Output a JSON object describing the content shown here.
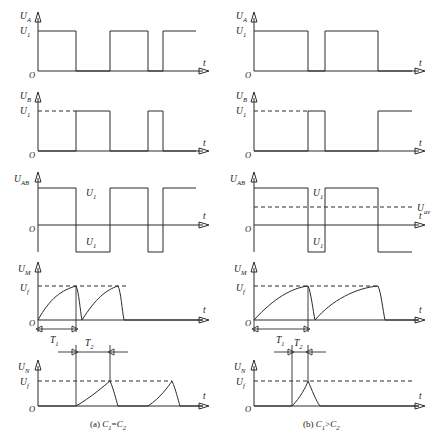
{
  "figure": {
    "background": "#ffffff",
    "ink": "#2b2b2b",
    "width": 436,
    "height": 440
  },
  "axis": {
    "origin_label": "O",
    "time_label": "t"
  },
  "columns": [
    {
      "id": "a",
      "caption_prefix": "(a)",
      "caption_expr": "C₁=C₂",
      "caption_c1": "C",
      "caption_c1_sub": "1",
      "caption_rel": "=",
      "caption_c2": "C",
      "caption_c2_sub": "2",
      "rows": [
        {
          "id": "ua",
          "signal": "U",
          "signal_sub": "A",
          "level_label": "U",
          "level_sub": "1",
          "kind": "square-unipolar",
          "dashed_ref": false,
          "duty": "50%",
          "edges_pct": [
            0,
            22,
            42,
            63,
            82,
            100
          ]
        },
        {
          "id": "ub",
          "signal": "U",
          "signal_sub": "B",
          "level_label": "U",
          "level_sub": "1",
          "kind": "square-unipolar",
          "dashed_ref": true,
          "duty": "50%",
          "edges_pct": [
            22,
            42,
            63,
            82
          ]
        },
        {
          "id": "uab",
          "signal": "U",
          "signal_sub": "AB",
          "level_pos_label": "U",
          "level_pos_sub": "1",
          "level_neg_label": "U",
          "level_neg_sub": "1",
          "kind": "square-bipolar",
          "avg_line": false,
          "avg_label": "",
          "avg_sub": ""
        },
        {
          "id": "um",
          "signal": "U",
          "signal_sub": "M",
          "level_label": "U",
          "level_sub": "f",
          "kind": "exponential-charge",
          "dim_label": "T",
          "dim_sub": "1",
          "cycles": 2
        },
        {
          "id": "un",
          "signal": "U",
          "signal_sub": "N",
          "level_label": "U",
          "level_sub": "f",
          "kind": "exponential-charge",
          "dim_label": "T",
          "dim_sub": "2",
          "cycles": 2
        }
      ]
    },
    {
      "id": "b",
      "caption_prefix": "(b)",
      "caption_expr": "C₁>C₂",
      "caption_c1": "C",
      "caption_c1_sub": "1",
      "caption_rel": ">",
      "caption_c2": "C",
      "caption_c2_sub": "2",
      "rows": [
        {
          "id": "ua",
          "signal": "U",
          "signal_sub": "A",
          "level_label": "U",
          "level_sub": "1",
          "kind": "square-unipolar",
          "dashed_ref": false,
          "duty": "70%",
          "edges_pct": [
            0,
            37,
            50,
            87,
            100
          ]
        },
        {
          "id": "ub",
          "signal": "U",
          "signal_sub": "B",
          "level_label": "U",
          "level_sub": "1",
          "kind": "square-unipolar",
          "dashed_ref": true,
          "duty": "30%",
          "edges_pct": [
            37,
            50,
            87
          ]
        },
        {
          "id": "uab",
          "signal": "U",
          "signal_sub": "AB",
          "level_pos_label": "U",
          "level_pos_sub": "1",
          "level_neg_label": "U",
          "level_neg_sub": "1",
          "kind": "square-bipolar",
          "avg_line": true,
          "avg_label": "U",
          "avg_sub": "av"
        },
        {
          "id": "um",
          "signal": "U",
          "signal_sub": "M",
          "level_label": "U",
          "level_sub": "f",
          "kind": "exponential-charge",
          "dim_label": "T",
          "dim_sub": "1",
          "cycles": 2
        },
        {
          "id": "un",
          "signal": "U",
          "signal_sub": "N",
          "level_label": "U",
          "level_sub": "f",
          "kind": "exponential-charge",
          "dim_label": "T",
          "dim_sub": "2",
          "cycles": 1
        }
      ]
    }
  ]
}
